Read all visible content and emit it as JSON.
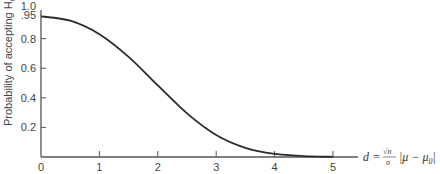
{
  "chart_data": {
    "type": "line",
    "title": "",
    "xlabel": "d = (√n/σ)|μ − μ0|",
    "ylabel": "Probability of accepting H0",
    "xlim": [
      0,
      5
    ],
    "ylim": [
      0,
      1.0
    ],
    "x_ticks": [
      "0",
      "1",
      "2",
      "3",
      "4",
      "5"
    ],
    "y_ticks": [
      "0.2",
      "0.4",
      "0.6",
      "0.8",
      ".95",
      "1.0"
    ],
    "grid": false,
    "legend": null,
    "series": [
      {
        "name": "OC curve",
        "x": [
          0,
          0.5,
          1.0,
          1.5,
          2.0,
          2.5,
          3.0,
          3.5,
          4.0,
          4.5,
          5.0
        ],
        "y": [
          0.95,
          0.921,
          0.83,
          0.677,
          0.484,
          0.295,
          0.149,
          0.062,
          0.021,
          0.006,
          0.001
        ]
      }
    ]
  },
  "axis": {
    "ylabel_text": "Probability of accepting H",
    "ylabel_sub": "0",
    "xlabel_d": "d",
    "xlabel_eq": "=",
    "xlabel_num": "√n",
    "xlabel_den": "σ",
    "xlabel_abs": "|μ − μ",
    "xlabel_sub": "0",
    "xlabel_close": "|"
  }
}
